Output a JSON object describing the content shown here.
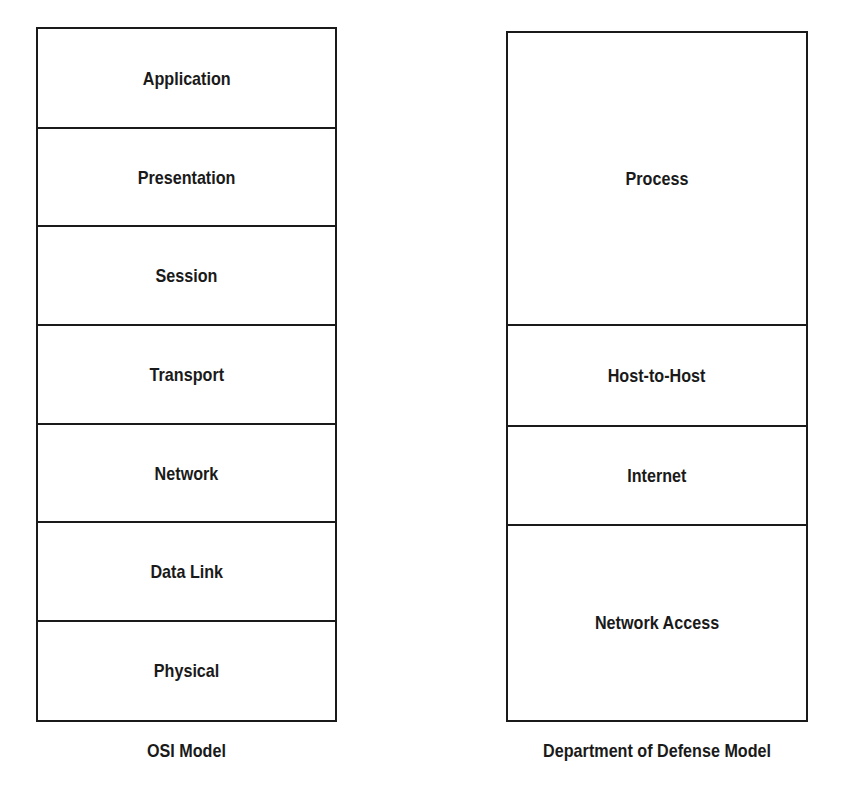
{
  "osi": {
    "caption": "OSI Model",
    "layers": [
      {
        "label": "Application"
      },
      {
        "label": "Presentation"
      },
      {
        "label": "Session"
      },
      {
        "label": "Transport"
      },
      {
        "label": "Network"
      },
      {
        "label": "Data Link"
      },
      {
        "label": "Physical"
      }
    ]
  },
  "dod": {
    "caption": "Department of Defense Model",
    "layers": [
      {
        "label": "Process",
        "spans_osi": [
          "Application",
          "Presentation",
          "Session"
        ]
      },
      {
        "label": "Host-to-Host",
        "spans_osi": [
          "Transport"
        ]
      },
      {
        "label": "Internet",
        "spans_osi": [
          "Network"
        ]
      },
      {
        "label": "Network Access",
        "spans_osi": [
          "Data Link",
          "Physical"
        ]
      }
    ]
  },
  "colors": {
    "line": "#1a1a1a",
    "background": "#ffffff"
  }
}
